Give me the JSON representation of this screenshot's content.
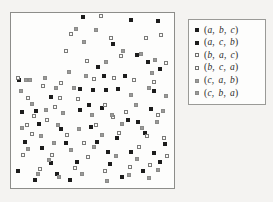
{
  "figure": {
    "background_color": "#f4f3f1",
    "panel_background": "#fdfdfc",
    "panel_border_color": "#8d8d8a"
  },
  "chart_data": {
    "type": "scatter",
    "title": "",
    "xlabel": "",
    "ylabel": "",
    "xlim": [
      0,
      100
    ],
    "ylim": [
      0,
      100
    ],
    "grid": false,
    "axis_ticks": false,
    "legend_position": "right",
    "marker_styles": {
      "m-a": {
        "name": "filled-black-square",
        "fill": "#1c1c1c",
        "edge": "#1c1c1c"
      },
      "m-b": {
        "name": "open-white-square",
        "fill": "#fbfbfa",
        "edge": "#7a7a78"
      },
      "m-c": {
        "name": "filled-gray-square",
        "fill": "#9a9a99",
        "edge": "#8a8a88"
      }
    },
    "series": [
      {
        "name": "(a, b, c)",
        "marker": "m-a",
        "tokens": [
          "a",
          "b",
          "c"
        ],
        "points": [
          [
            44.2,
            98.9
          ],
          [
            62.9,
            83.0
          ],
          [
            74.5,
            97.2
          ],
          [
            91.5,
            96.6
          ],
          [
            78.2,
            76.8
          ],
          [
            53.3,
            69.5
          ],
          [
            42.4,
            56.5
          ],
          [
            50.3,
            55.9
          ],
          [
            58.8,
            55.9
          ],
          [
            66.1,
            56.5
          ],
          [
            3.6,
            62.1
          ],
          [
            24.2,
            52.0
          ],
          [
            92.7,
            68.4
          ],
          [
            88.5,
            55.4
          ],
          [
            86.7,
            45.2
          ],
          [
            84.9,
            72.3
          ],
          [
            42.4,
            44.6
          ],
          [
            14.5,
            44.1
          ],
          [
            5.4,
            43.5
          ],
          [
            83.0,
            31.1
          ],
          [
            33.3,
            24.9
          ],
          [
            52.7,
            26.0
          ],
          [
            65.5,
            28.2
          ],
          [
            95.8,
            24.3
          ],
          [
            18.2,
            22.0
          ],
          [
            40.0,
            14.1
          ],
          [
            61.2,
            13.0
          ],
          [
            3.0,
            8.5
          ],
          [
            16.4,
            36.2
          ],
          [
            30.3,
            33.4
          ],
          [
            72.1,
            38.5
          ],
          [
            78.8,
            37.3
          ],
          [
            47.9,
            47.4
          ],
          [
            55.8,
            45.8
          ],
          [
            92.7,
            14.1
          ],
          [
            81.8,
            8.5
          ],
          [
            27.9,
            7.3
          ],
          [
            68.5,
            5.1
          ],
          [
            35.8,
            3.4
          ],
          [
            13.9,
            3.4
          ],
          [
            60.0,
            19.8
          ],
          [
            88.5,
            19.2
          ],
          [
            49.1,
            34.5
          ],
          [
            74.5,
            19.8
          ],
          [
            23.6,
            13.6
          ],
          [
            7.3,
            26.0
          ],
          [
            57.0,
            64.4
          ],
          [
            70.3,
            64.4
          ]
        ]
      },
      {
        "name": "(a, c, b)",
        "marker": "m-a",
        "tokens": [
          "a",
          "c",
          "b"
        ],
        "points": []
      },
      {
        "name": "(b, a, c)",
        "marker": "m-b",
        "tokens": [
          "b",
          "a",
          "c"
        ],
        "points": [
          [
            55.2,
            99.4
          ],
          [
            36.4,
            88.7
          ],
          [
            61.8,
            86.4
          ],
          [
            83.6,
            86.4
          ],
          [
            33.3,
            79.1
          ],
          [
            46.7,
            72.9
          ],
          [
            50.9,
            62.7
          ],
          [
            63.6,
            63.3
          ],
          [
            75.8,
            62.1
          ],
          [
            96.4,
            71.8
          ],
          [
            88.5,
            61.0
          ],
          [
            18.8,
            58.2
          ],
          [
            9.7,
            51.4
          ],
          [
            29.7,
            51.4
          ],
          [
            40.6,
            50.8
          ],
          [
            3.0,
            63.3
          ],
          [
            13.3,
            40.7
          ],
          [
            21.2,
            38.5
          ],
          [
            26.7,
            46.3
          ],
          [
            57.6,
            47.4
          ],
          [
            70.9,
            43.5
          ],
          [
            91.5,
            41.8
          ],
          [
            12.1,
            30.5
          ],
          [
            33.9,
            30.0
          ],
          [
            44.8,
            25.4
          ],
          [
            52.1,
            35.6
          ],
          [
            66.7,
            31.1
          ],
          [
            84.2,
            29.4
          ],
          [
            95.2,
            28.2
          ],
          [
            6.1,
            18.1
          ],
          [
            24.8,
            18.1
          ],
          [
            38.8,
            10.7
          ],
          [
            57.6,
            8.5
          ],
          [
            73.3,
            11.3
          ],
          [
            86.1,
            12.4
          ],
          [
            97.0,
            17.5
          ],
          [
            17.0,
            10.2
          ],
          [
            47.3,
            16.9
          ],
          [
            79.4,
            22.6
          ],
          [
            30.3,
            60.5
          ],
          [
            67.9,
            76.3
          ],
          [
            8.5,
            35.6
          ],
          [
            63.0,
            40.1
          ],
          [
            93.3,
            88.1
          ]
        ]
      },
      {
        "name": "(b, c, a)",
        "marker": "m-b",
        "tokens": [
          "b",
          "c",
          "a"
        ],
        "points": []
      },
      {
        "name": "(c, a, b)",
        "marker": "m-c",
        "tokens": [
          "c",
          "a",
          "b"
        ],
        "points": [
          [
            39.4,
            92.1
          ],
          [
            52.1,
            91.5
          ],
          [
            44.8,
            84.2
          ],
          [
            69.1,
            79.1
          ],
          [
            80.6,
            77.4
          ],
          [
            89.1,
            73.5
          ],
          [
            58.2,
            72.3
          ],
          [
            35.2,
            66.7
          ],
          [
            20.0,
            63.3
          ],
          [
            7.9,
            62.1
          ],
          [
            10.9,
            62.1
          ],
          [
            4.8,
            55.4
          ],
          [
            27.3,
            57.1
          ],
          [
            38.2,
            57.1
          ],
          [
            85.5,
            57.1
          ],
          [
            73.9,
            53.1
          ],
          [
            12.1,
            48.0
          ],
          [
            20.6,
            44.6
          ],
          [
            31.5,
            42.4
          ],
          [
            49.7,
            41.3
          ],
          [
            62.4,
            41.3
          ],
          [
            77.6,
            47.4
          ],
          [
            90.3,
            37.3
          ],
          [
            5.5,
            33.9
          ],
          [
            17.6,
            29.4
          ],
          [
            28.5,
            35.6
          ],
          [
            41.8,
            33.4
          ],
          [
            55.8,
            30.0
          ],
          [
            68.5,
            36.2
          ],
          [
            81.2,
            33.9
          ],
          [
            94.5,
            44.1
          ],
          [
            9.7,
            21.5
          ],
          [
            22.4,
            15.3
          ],
          [
            36.4,
            20.9
          ],
          [
            50.9,
            22.6
          ],
          [
            64.8,
            17.5
          ],
          [
            78.2,
            15.8
          ],
          [
            91.5,
            9.6
          ],
          [
            15.8,
            6.8
          ],
          [
            29.1,
            5.1
          ],
          [
            43.6,
            6.8
          ],
          [
            72.7,
            6.2
          ],
          [
            85.5,
            4.5
          ],
          [
            59.4,
            2.8
          ],
          [
            96.4,
            52.5
          ],
          [
            46.1,
            64.4
          ],
          [
            25.5,
            25.4
          ],
          [
            87.3,
            66.1
          ]
        ]
      },
      {
        "name": "(c, b, a)",
        "marker": "m-c",
        "tokens": [
          "c",
          "b",
          "a"
        ],
        "points": []
      }
    ]
  },
  "legend": {
    "entries": [
      {
        "label": "(a, b, c)",
        "marker": "m-a",
        "tokens": [
          "a",
          "b",
          "c"
        ]
      },
      {
        "label": "(a, c, b)",
        "marker": "m-a",
        "tokens": [
          "a",
          "c",
          "b"
        ]
      },
      {
        "label": "(b, a, c)",
        "marker": "m-b",
        "tokens": [
          "b",
          "a",
          "c"
        ]
      },
      {
        "label": "(b, c, a)",
        "marker": "m-b",
        "tokens": [
          "b",
          "c",
          "a"
        ]
      },
      {
        "label": "(c, a, b)",
        "marker": "m-c",
        "tokens": [
          "c",
          "a",
          "b"
        ]
      },
      {
        "label": "(c, b, a)",
        "marker": "m-c",
        "tokens": [
          "c",
          "b",
          "a"
        ]
      }
    ]
  }
}
